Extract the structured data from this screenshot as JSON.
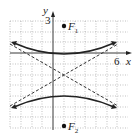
{
  "axes": {
    "x_label": "x",
    "y_label": "y",
    "x_tick_label": "6",
    "y_tick_label": "3",
    "x_range": [
      -4,
      7
    ],
    "y_range": [
      -7,
      3
    ]
  },
  "points": {
    "f1": {
      "label": "F",
      "sub": "1",
      "x": 1,
      "y": 2
    },
    "f2": {
      "label": "F",
      "sub": "2",
      "x": 1,
      "y": -6
    }
  },
  "curve": {
    "type": "hyperbola",
    "center": [
      1,
      -2
    ],
    "a": 2,
    "c": 4,
    "orientation": "vertical",
    "vertices": [
      [
        1,
        0
      ],
      [
        1,
        -4
      ]
    ]
  },
  "colors": {
    "curve": "#222222",
    "grid": "#999999",
    "asymptote": "#333333"
  }
}
